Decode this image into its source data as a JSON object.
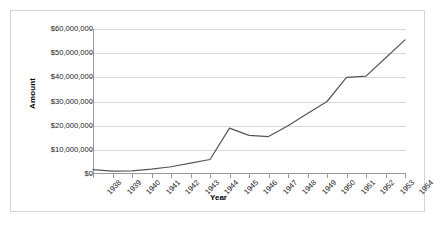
{
  "chart_data": {
    "type": "line",
    "title": "",
    "xlabel": "Year",
    "ylabel": "Amount",
    "categories": [
      "1938",
      "1939",
      "1940",
      "1941",
      "1942",
      "1943",
      "1944",
      "1945",
      "1946",
      "1947",
      "1948",
      "1949",
      "1950",
      "1951",
      "1952",
      "1953",
      "1954"
    ],
    "values": [
      1800000,
      1200000,
      1300000,
      2000000,
      3000000,
      4500000,
      6000000,
      19000000,
      16000000,
      15500000,
      20000000,
      25000000,
      30000000,
      40000000,
      40500000,
      48000000,
      55500000
    ],
    "series": [
      {
        "name": "Amount",
        "values": [
          1800000,
          1200000,
          1300000,
          2000000,
          3000000,
          4500000,
          6000000,
          19000000,
          16000000,
          15500000,
          20000000,
          25000000,
          30000000,
          40000000,
          40500000,
          48000000,
          55500000
        ]
      }
    ],
    "ylim": [
      0,
      60000000
    ],
    "yticks": [
      0,
      10000000,
      20000000,
      30000000,
      40000000,
      50000000,
      60000000
    ],
    "ytick_labels": [
      "$0",
      "$10,000,000",
      "$20,000,000",
      "$30,000,000",
      "$40,000,000",
      "$50,000,000",
      "$60,000,000"
    ],
    "grid": true,
    "grid_axis": "y",
    "legend": false,
    "legend_position": "none",
    "line_color": "#555555",
    "grid_color": "#d9d9d9",
    "axis_color": "#9a9a9a",
    "background_color": "#ffffff",
    "border_color": "#d4d4d4"
  },
  "axis": {
    "y_title": "Amount",
    "x_title": "Year"
  }
}
